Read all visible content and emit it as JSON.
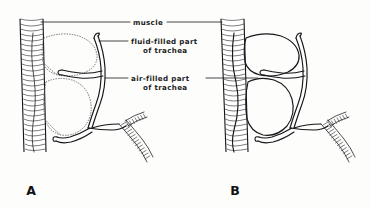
{
  "figure": {
    "background_color": "#fdfdfc",
    "ink_color": "#16161a",
    "dotted_color": "#5d5d62",
    "width": 371,
    "height": 208
  },
  "annotations": {
    "muscle": {
      "label": "muscle",
      "line1": "muscle",
      "line2": ""
    },
    "fluid_filled": {
      "label": "fluid-filled part of trachea",
      "line1": "fluid-filled part",
      "line2": "of  trachea"
    },
    "air_filled": {
      "label": "air-filled part of trachea",
      "line1": "air-filled part",
      "line2": "of  trachea"
    }
  },
  "panels": [
    {
      "id": "A",
      "letter": "A",
      "description": "Trachea with fluid-filled sacs shown as dotted outlines and air-filled tubes as solid double lines"
    },
    {
      "id": "B",
      "letter": "B",
      "description": "Trachea fully air-filled, all tubes drawn as solid double lines"
    }
  ]
}
